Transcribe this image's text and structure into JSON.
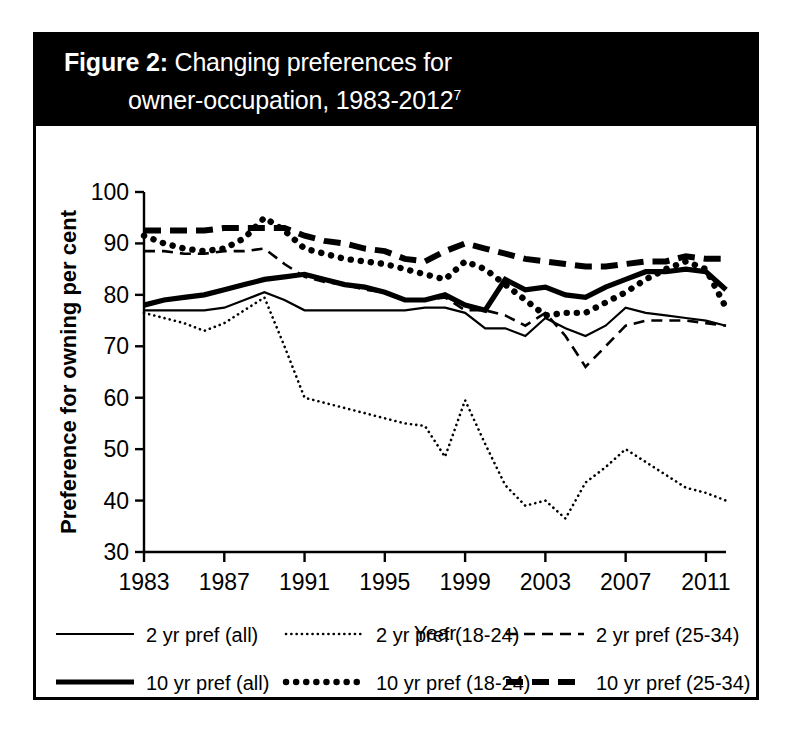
{
  "figure": {
    "title_label": "Figure 2:",
    "title_line1": "Changing preferences for",
    "title_line2": "owner-occupation, 1983-2012",
    "footnote_marker": "7",
    "background": "#ffffff",
    "title_bar_color": "#000000",
    "ink_color": "#000000"
  },
  "chart_data": {
    "type": "line",
    "title": "Figure 2: Changing preferences for owner-occupation, 1983-2012",
    "xlabel": "Year",
    "ylabel": "Preference for owning per cent",
    "xlim": [
      1983,
      2012
    ],
    "ylim": [
      30,
      100
    ],
    "xticks": [
      "1983",
      "1987",
      "1991",
      "1995",
      "1999",
      "2003",
      "2007",
      "2011"
    ],
    "xtick_values": [
      1983,
      1987,
      1991,
      1995,
      1999,
      2003,
      2007,
      2011
    ],
    "yticks": [
      "30",
      "40",
      "50",
      "60",
      "70",
      "80",
      "90",
      "100"
    ],
    "ytick_values": [
      30,
      40,
      50,
      60,
      70,
      80,
      90,
      100
    ],
    "grid": false,
    "legend_position": "below",
    "x": [
      1983,
      1984,
      1985,
      1986,
      1987,
      1988,
      1989,
      1990,
      1991,
      1992,
      1993,
      1994,
      1995,
      1996,
      1997,
      1998,
      1999,
      2000,
      2001,
      2002,
      2003,
      2004,
      2005,
      2006,
      2007,
      2008,
      2009,
      2010,
      2011,
      2012
    ],
    "series": [
      {
        "name": "2 yr pref (all)",
        "style": "thin-solid",
        "values": [
          77,
          77,
          77,
          77,
          77.5,
          79,
          80.5,
          79,
          77,
          77,
          77,
          77,
          77,
          77,
          77.5,
          77.5,
          76.5,
          73.5,
          73.5,
          72,
          75.5,
          73.5,
          72,
          74,
          77.5,
          76.5,
          76,
          75.5,
          75,
          74
        ]
      },
      {
        "name": "2 yr pref (18-24)",
        "style": "thin-dotted",
        "values": [
          76.5,
          75.5,
          74.5,
          73,
          74.5,
          77,
          79.5,
          70,
          60,
          59,
          58,
          57,
          56,
          55,
          54.5,
          48.5,
          59.5,
          51,
          43,
          39,
          40,
          36.5,
          43.5,
          46.5,
          50,
          47.5,
          45,
          42.5,
          41.5,
          40
        ]
      },
      {
        "name": "2 yr pref (25-34)",
        "style": "thin-dashed",
        "values": [
          88.5,
          88.5,
          88,
          88,
          88.5,
          88.5,
          89,
          86,
          83.5,
          82.5,
          82,
          81,
          80.5,
          79,
          79,
          79.5,
          77,
          77,
          76,
          74,
          76.5,
          72,
          66,
          70,
          74,
          75,
          75,
          75,
          74.5,
          74
        ]
      },
      {
        "name": "10 yr pref (all)",
        "style": "thick-solid",
        "values": [
          78,
          79,
          79.5,
          80,
          81,
          82,
          83,
          83.5,
          84,
          83,
          82,
          81.5,
          80.5,
          79,
          79,
          80,
          78,
          77,
          83,
          81,
          81.5,
          80,
          79.5,
          81.5,
          83,
          84.5,
          84.5,
          85,
          84.5,
          81
        ]
      },
      {
        "name": "10 yr pref (18-24)",
        "style": "thick-dotted",
        "values": [
          91.5,
          90,
          89,
          88.5,
          89,
          91,
          95,
          92.5,
          89,
          88,
          87,
          86.5,
          86,
          85,
          84,
          83,
          86.5,
          85,
          82,
          79,
          76,
          76.5,
          76.5,
          78.5,
          80.5,
          83,
          85,
          86.5,
          85,
          77.5
        ]
      },
      {
        "name": "10 yr pref (25-34)",
        "style": "thick-dashed",
        "values": [
          92.5,
          92.5,
          92.5,
          92.5,
          93,
          93,
          93,
          93,
          91.5,
          90.5,
          90,
          89,
          88.5,
          87,
          86.5,
          88.5,
          90,
          89,
          88,
          87,
          86.5,
          86,
          85.5,
          85.5,
          86,
          86.5,
          86.5,
          87.5,
          87,
          87
        ]
      }
    ]
  },
  "legend": {
    "items": [
      {
        "label": "2 yr pref (all)",
        "style": "thin-solid"
      },
      {
        "label": "2 yr pref (18-24)",
        "style": "thin-dotted"
      },
      {
        "label": "2 yr pref (25-34)",
        "style": "thin-dashed"
      },
      {
        "label": "10 yr pref (all)",
        "style": "thick-solid"
      },
      {
        "label": "10 yr pref (18-24)",
        "style": "thick-dotted"
      },
      {
        "label": "10 yr pref (25-34)",
        "style": "thick-dashed"
      }
    ]
  }
}
